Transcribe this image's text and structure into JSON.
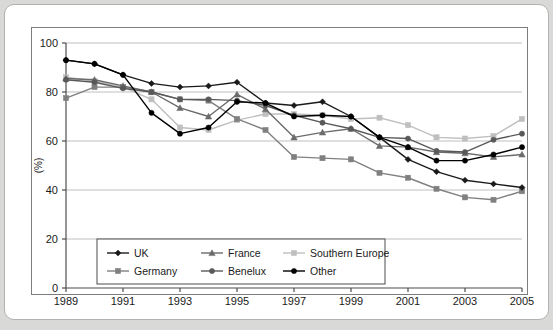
{
  "chart_data": {
    "type": "line",
    "title": "",
    "xlabel": "",
    "ylabel": "(%)",
    "xlim": [
      1989,
      2005
    ],
    "ylim": [
      0,
      100
    ],
    "yticks": [
      0,
      20,
      40,
      60,
      80,
      100
    ],
    "xticks": [
      1989,
      1991,
      1993,
      1995,
      1997,
      1999,
      2001,
      2003,
      2005
    ],
    "xtick_labels": [
      "1989",
      "1991",
      "1993",
      "1995",
      "1997",
      "1999",
      "2001",
      "2003",
      "2005"
    ],
    "ytick_labels": [
      "0",
      "20",
      "40",
      "60",
      "80",
      "100"
    ],
    "grid": "horizontal",
    "legend_position": "bottom-left-inside",
    "x": [
      1989,
      1990,
      1991,
      1992,
      1993,
      1994,
      1995,
      1996,
      1997,
      1998,
      1999,
      2000,
      2001,
      2002,
      2003,
      2004,
      2005
    ],
    "series": [
      {
        "name": "UK",
        "color": "#1a1a1a",
        "marker": "diamond",
        "values": [
          93.0,
          91.5,
          87.0,
          83.5,
          82.0,
          82.5,
          84.0,
          75.5,
          74.5,
          76.0,
          70.0,
          61.5,
          52.5,
          47.5,
          44.0,
          42.5,
          41.0
        ]
      },
      {
        "name": "France",
        "color": "#6b6b6b",
        "marker": "triangle",
        "values": [
          85.5,
          85.0,
          82.5,
          80.0,
          73.5,
          70.0,
          79.0,
          73.0,
          61.5,
          63.5,
          65.0,
          58.0,
          57.5,
          55.5,
          55.0,
          53.5,
          54.5
        ]
      },
      {
        "name": "Southern Europe",
        "color": "#bfbfbf",
        "marker": "square",
        "values": [
          86.0,
          84.5,
          82.0,
          77.0,
          65.5,
          64.5,
          68.5,
          71.0,
          71.0,
          70.5,
          69.0,
          69.5,
          66.5,
          61.5,
          61.0,
          62.0,
          69.0
        ]
      },
      {
        "name": "Germany",
        "color": "#808080",
        "marker": "square",
        "values": [
          77.5,
          82.0,
          82.0,
          80.0,
          77.0,
          76.5,
          69.0,
          64.5,
          53.5,
          53.0,
          52.5,
          47.0,
          45.0,
          40.5,
          37.0,
          36.0,
          39.5
        ]
      },
      {
        "name": "Benelux",
        "color": "#595959",
        "marker": "circle",
        "values": [
          85.0,
          84.0,
          81.5,
          80.0,
          77.0,
          77.0,
          76.5,
          74.5,
          70.5,
          67.5,
          65.0,
          61.5,
          61.0,
          56.0,
          55.5,
          60.5,
          63.0
        ]
      },
      {
        "name": "Other",
        "color": "#000000",
        "marker": "circle",
        "values": [
          93.0,
          91.5,
          87.0,
          71.5,
          63.0,
          65.5,
          76.0,
          75.5,
          70.0,
          70.5,
          70.0,
          61.5,
          57.5,
          52.0,
          52.0,
          54.5,
          57.5
        ]
      }
    ],
    "legend": [
      {
        "label": "UK",
        "color": "#1a1a1a",
        "marker": "diamond"
      },
      {
        "label": "France",
        "color": "#6b6b6b",
        "marker": "triangle"
      },
      {
        "label": "Southern Europe",
        "color": "#bfbfbf",
        "marker": "square"
      },
      {
        "label": "Germany",
        "color": "#808080",
        "marker": "square"
      },
      {
        "label": "Benelux",
        "color": "#595959",
        "marker": "circle"
      },
      {
        "label": "Other",
        "color": "#000000",
        "marker": "circle"
      }
    ]
  }
}
